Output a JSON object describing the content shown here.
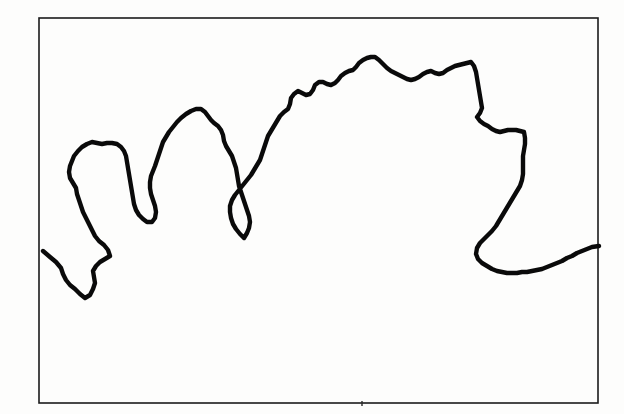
{
  "figure": {
    "type": "line-drawing",
    "title": "Hand-drawn jagged coastline contour inside rectangular frame",
    "background_color": "#fdfdfc",
    "ink_color": "#0a0a0a",
    "frame_color": "#1b1b1b"
  },
  "frame": {
    "name": "bounding-rectangle",
    "x": 39,
    "y": 18,
    "width": 559,
    "height": 385,
    "stroke_width": 1.6
  },
  "contour": {
    "name": "coastline-contour",
    "stroke_width": 4.4,
    "start_point": [
      43,
      251
    ],
    "end_point": [
      599,
      246
    ],
    "description": "Irregular hand-inked outline rising from lower-left, forming three rounded peninsulas, a high jagged central massif, then descending along the right into a broad bay that meets the right frame edge.",
    "path": "M 43 251 L 50 257 L 56 262 L 61 268 L 63 274 L 66 280 L 70 285 L 75 289 L 80 294 L 85 298 L 90 295 L 93 289 L 95 283 L 94 277 L 93 271 L 96 266 L 100 262 L 105 259 L 110 256 L 108 250 L 104 245 L 99 241 L 95 236 L 92 230 L 89 224 L 86 218 L 83 212 L 81 206 L 79 200 L 77 194 L 76 188 L 73 183 L 70 178 L 69 172 L 70 166 L 72 161 L 74 156 L 78 151 L 82 147 L 87 144 L 92 142 L 97 143 L 102 144 L 107 143 L 112 143 L 117 144 L 121 147 L 124 151 L 126 156 L 127 162 L 128 168 L 129 174 L 130 180 L 131 186 L 132 192 L 133 198 L 134 204 L 136 210 L 139 215 L 143 219 L 147 222 L 152 222 L 155 218 L 156 212 L 155 206 L 153 200 L 151 194 L 150 188 L 150 182 L 151 176 L 153 171 L 155 166 L 157 160 L 159 154 L 161 148 L 163 142 L 166 137 L 169 132 L 173 127 L 177 122 L 181 118 L 186 114 L 191 111 L 196 109 L 201 109 L 205 112 L 208 116 L 211 120 L 214 123 L 218 126 L 221 130 L 223 135 L 224 141 L 226 146 L 229 151 L 232 156 L 234 162 L 236 168 L 237 174 L 238 180 L 239 186 L 241 192 L 243 198 L 245 204 L 247 210 L 249 216 L 250 222 L 249 228 L 247 233 L 244 238 L 240 234 L 236 229 L 233 224 L 231 218 L 230 212 L 230 206 L 232 200 L 235 195 L 239 190 L 243 185 L 247 180 L 251 175 L 254 170 L 257 165 L 260 160 L 262 154 L 264 148 L 266 142 L 268 136 L 271 131 L 274 126 L 277 121 L 280 116 L 284 112 L 288 109 L 290 104 L 291 98 L 294 94 L 298 91 L 302 93 L 306 95 L 310 94 L 313 90 L 315 85 L 319 82 L 323 82 L 327 84 L 331 85 L 335 83 L 338 80 L 341 76 L 345 73 L 349 71 L 353 70 L 356 67 L 359 63 L 363 60 L 367 58 L 371 57 L 375 57 L 379 60 L 383 64 L 387 68 L 391 71 L 395 73 L 399 75 L 403 77 L 407 79 L 411 80 L 415 79 L 419 77 L 423 74 L 427 72 L 431 71 L 435 73 L 439 74 L 443 73 L 447 70 L 451 68 L 455 66 L 459 65 L 463 64 L 467 63 L 471 62 L 474 66 L 476 72 L 477 78 L 478 84 L 479 90 L 480 96 L 481 102 L 482 108 L 480 113 L 477 117 L 480 121 L 484 124 L 488 126 L 492 129 L 496 131 L 500 132 L 504 131 L 508 130 L 512 130 L 516 130 L 520 131 L 524 132 L 525 138 L 525 144 L 524 150 L 523 156 L 523 162 L 523 168 L 523 174 L 522 180 L 520 186 L 517 191 L 514 196 L 511 201 L 508 206 L 505 211 L 502 216 L 499 221 L 496 226 L 492 231 L 488 235 L 484 239 L 480 243 L 477 248 L 476 254 L 478 259 L 482 263 L 487 266 L 492 269 L 497 271 L 502 272 L 507 273 L 512 273 L 517 273 L 522 272 L 527 272 L 532 271 L 537 270 L 542 269 L 547 267 L 552 265 L 557 263 L 562 261 L 567 258 L 572 256 L 577 253 L 582 251 L 587 249 L 592 247 L 599 246"
  },
  "marks": {
    "bottom_tick": {
      "name": "bottom-edge-tick",
      "x": 362,
      "y1": 401,
      "y2": 406
    }
  }
}
